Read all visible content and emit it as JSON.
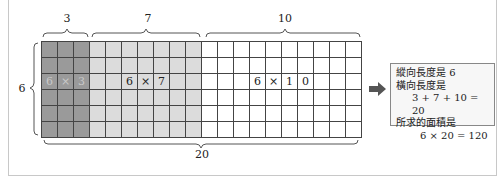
{
  "diagram": {
    "grid": {
      "rows": 6,
      "cols": 20,
      "segments": [
        {
          "width": 3,
          "shade": "dark",
          "color": "#9a9a9a",
          "label": "3",
          "product": [
            "6",
            "×",
            "3"
          ]
        },
        {
          "width": 7,
          "shade": "light",
          "color": "#dcdcdc",
          "label": "7",
          "product": [
            "6",
            "×",
            "7"
          ]
        },
        {
          "width": 10,
          "shade": "white",
          "color": "#ffffff",
          "label": "10",
          "product": [
            "6",
            "×",
            "1",
            "0"
          ]
        }
      ]
    },
    "left_label": "6",
    "bottom_label": "20",
    "top_labels": [
      "3",
      "7",
      "10"
    ]
  },
  "infobox": {
    "line1": "縱向長度是 6",
    "line2": "橫向長度是",
    "line3": "3 + 7 + 10 = 20",
    "line4": "所求的面積是",
    "line5": "6 × 20 = 120"
  },
  "arrow_icon": "right-arrow-icon"
}
